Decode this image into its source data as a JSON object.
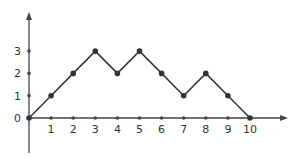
{
  "chart_data": {
    "type": "line",
    "title": "",
    "xlabel": "",
    "ylabel": "",
    "x": [
      0,
      1,
      2,
      3,
      4,
      5,
      6,
      7,
      8,
      9,
      10
    ],
    "series": [
      {
        "name": "path",
        "values": [
          0,
          1,
          2,
          3,
          2,
          3,
          2,
          1,
          2,
          1,
          0
        ]
      }
    ],
    "x_ticks": [
      "1",
      "2",
      "3",
      "4",
      "5",
      "6",
      "7",
      "8",
      "9",
      "10"
    ],
    "y_ticks": [
      "0",
      "1",
      "2",
      "3"
    ],
    "xlim": [
      0,
      11
    ],
    "ylim": [
      -1.5,
      4.6
    ],
    "grid": false,
    "legend": "none",
    "colors": {
      "line": "#333333",
      "axis": "#444444"
    }
  }
}
